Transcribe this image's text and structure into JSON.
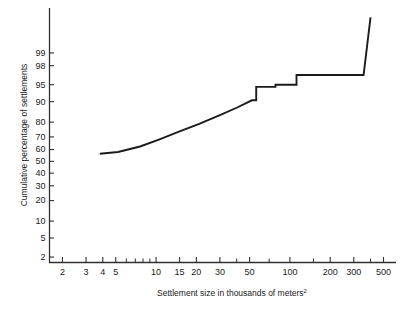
{
  "chart_data": {
    "type": "line",
    "title": "",
    "subtitle": "",
    "xlabel": "Settlement size in thousands of meters",
    "xlabel_superscript": "2",
    "ylabel": "Cumulative percentage of settlements",
    "x_scale": "log",
    "y_scale": "probability",
    "xlim": [
      1.6,
      620
    ],
    "ylim": [
      1.5,
      99.95
    ],
    "grid": false,
    "legend": null,
    "x_ticks": [
      {
        "value": 2,
        "label": "2",
        "major": true
      },
      {
        "value": 3,
        "label": "3",
        "major": true
      },
      {
        "value": 4,
        "label": "4",
        "major": true
      },
      {
        "value": 5,
        "label": "5",
        "major": true
      },
      {
        "value": 6,
        "label": "",
        "major": false
      },
      {
        "value": 7,
        "label": "",
        "major": false
      },
      {
        "value": 8,
        "label": "",
        "major": false
      },
      {
        "value": 9,
        "label": "",
        "major": false
      },
      {
        "value": 10,
        "label": "10",
        "major": true
      },
      {
        "value": 15,
        "label": "15",
        "major": true
      },
      {
        "value": 20,
        "label": "20",
        "major": true
      },
      {
        "value": 30,
        "label": "30",
        "major": true
      },
      {
        "value": 40,
        "label": "",
        "major": false
      },
      {
        "value": 50,
        "label": "50",
        "major": true
      },
      {
        "value": 70,
        "label": "",
        "major": false
      },
      {
        "value": 100,
        "label": "100",
        "major": true
      },
      {
        "value": 150,
        "label": "",
        "major": false
      },
      {
        "value": 200,
        "label": "200",
        "major": true
      },
      {
        "value": 300,
        "label": "300",
        "major": true
      },
      {
        "value": 400,
        "label": "",
        "major": false
      },
      {
        "value": 500,
        "label": "500",
        "major": true
      }
    ],
    "y_ticks": [
      {
        "value": 99,
        "label": "99"
      },
      {
        "value": 98,
        "label": "98"
      },
      {
        "value": 95,
        "label": "95"
      },
      {
        "value": 90,
        "label": "90"
      },
      {
        "value": 80,
        "label": "80"
      },
      {
        "value": 70,
        "label": "70"
      },
      {
        "value": 60,
        "label": "60"
      },
      {
        "value": 50,
        "label": "50"
      },
      {
        "value": 40,
        "label": "40"
      },
      {
        "value": 30,
        "label": "30"
      },
      {
        "value": 20,
        "label": "20"
      },
      {
        "value": 10,
        "label": "10"
      },
      {
        "value": 5,
        "label": "5"
      },
      {
        "value": 2,
        "label": "2"
      }
    ],
    "series": [
      {
        "name": "Cumulative settlement size distribution",
        "points": [
          {
            "x": 3.8,
            "y": 56.5
          },
          {
            "x": 5.2,
            "y": 58.0
          },
          {
            "x": 7.6,
            "y": 62.5
          },
          {
            "x": 10.5,
            "y": 68.0
          },
          {
            "x": 15.0,
            "y": 74.0
          },
          {
            "x": 21.0,
            "y": 79.0
          },
          {
            "x": 30.0,
            "y": 84.0
          },
          {
            "x": 40.0,
            "y": 87.5
          },
          {
            "x": 52.0,
            "y": 90.5
          },
          {
            "x": 56.0,
            "y": 90.5
          },
          {
            "x": 56.0,
            "y": 94.5
          },
          {
            "x": 78.0,
            "y": 94.5
          },
          {
            "x": 78.0,
            "y": 95.0
          },
          {
            "x": 112.0,
            "y": 95.0
          },
          {
            "x": 112.0,
            "y": 96.8
          },
          {
            "x": 355.0,
            "y": 96.8
          },
          {
            "x": 400.0,
            "y": 99.9
          }
        ]
      }
    ]
  }
}
